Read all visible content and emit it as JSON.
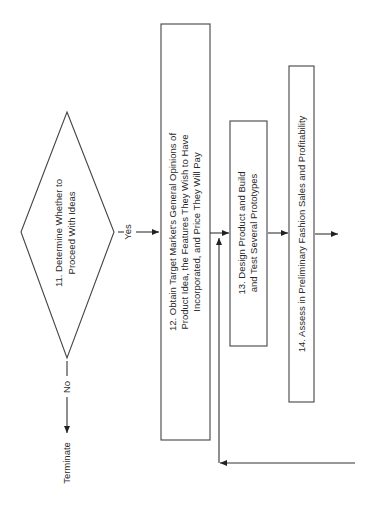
{
  "diagram": {
    "type": "flowchart",
    "orientation": "rotated-90-ccw",
    "nodes": {
      "decision11": {
        "number": "11.",
        "line1": "11.  Determine Whether to",
        "line2": "Proceed With Ideas"
      },
      "step12": {
        "line1": "12.  Obtain Target Market's General Opinions of",
        "line2": "Product Idea, the Features They Wish to Have",
        "line3": "Incorporated, and Price They Will Pay"
      },
      "step13": {
        "line1": "13.  Design Product and Build",
        "line2": "and Test Several Prototypes"
      },
      "step14": {
        "line1": "14.  Assess in Preliminary Fashion Sales and Profitability"
      },
      "terminate": {
        "label": "Terminate"
      }
    },
    "edges": {
      "yes_label": "Yes",
      "no_label": "No"
    },
    "colors": {
      "stroke": "#444444",
      "text": "#2a2a2a",
      "background": "#ffffff"
    }
  }
}
